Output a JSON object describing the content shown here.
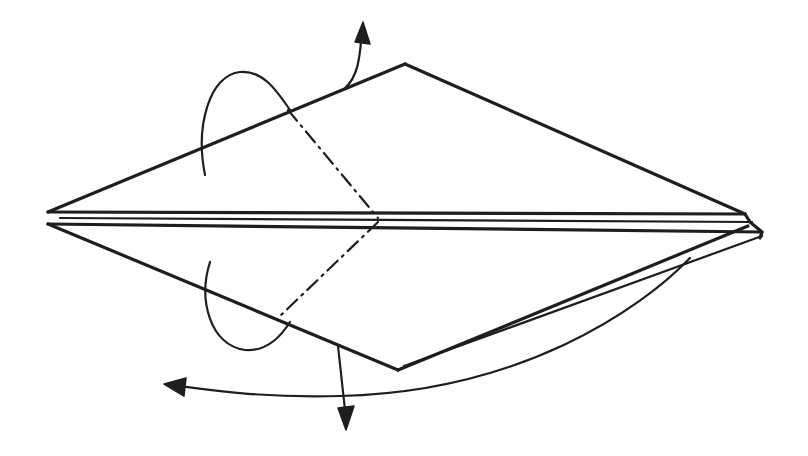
{
  "diagram": {
    "type": "origami-fold-instruction",
    "background": "#ffffff",
    "ink": "#1e1e1e",
    "model_edges": [
      {
        "name": "upper-left-edge",
        "d": "M48 212 L405 64"
      },
      {
        "name": "upper-right-edge",
        "d": "M405 64 L745 214"
      },
      {
        "name": "lower-left-edge",
        "d": "M48 224 L398 370"
      },
      {
        "name": "lower-right-edge-front",
        "d": "M398 370 L748 226"
      },
      {
        "name": "lower-right-edge-back",
        "d": "M404 366 L762 236"
      },
      {
        "name": "center-layer-1",
        "d": "M48 212 L745 214"
      },
      {
        "name": "center-layer-2",
        "d": "M60 218 L752 222"
      },
      {
        "name": "center-layer-3",
        "d": "M48 224 L762 232"
      },
      {
        "name": "right-tip",
        "d": "M745 214 L750 222 L762 232 L760 238"
      }
    ],
    "fold_lines": [
      {
        "name": "upper-mountain-fold-line",
        "d": "M288 110 L378 218"
      },
      {
        "name": "lower-mountain-fold-line",
        "d": "M378 222 L278 318"
      }
    ],
    "arrows": [
      {
        "name": "upper-fold-behind-arrow",
        "d": "M205 175 C195 125 210 75 240 72 C262 70 275 88 290 110",
        "head": null
      },
      {
        "name": "upper-flip-arrow",
        "d": "M345 88 C360 75 360 50 362 32",
        "head": "M355 42 L363 22 L370 44 Z"
      },
      {
        "name": "lower-fold-behind-arrow",
        "d": "M210 262 C198 300 210 345 245 350 C270 352 285 330 290 322",
        "head": null
      },
      {
        "name": "lower-flip-arrow",
        "d": "M338 346 L345 410",
        "head": "M338 408 L346 430 L354 406 Z"
      },
      {
        "name": "turn-over-arrow",
        "d": "M690 258 C640 310 520 392 340 396 C260 398 210 390 180 386",
        "head": "M186 378 L164 384 L184 396 Z"
      }
    ]
  }
}
